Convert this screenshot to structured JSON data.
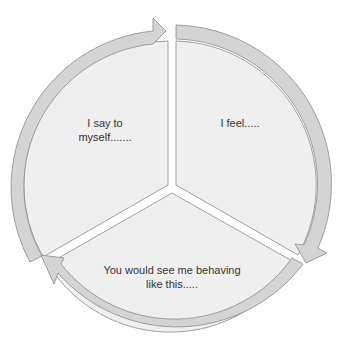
{
  "diagram": {
    "type": "cycle",
    "segments": [
      {
        "id": "self-talk",
        "label_lines": [
          "I say to",
          "myself......."
        ]
      },
      {
        "id": "feelings",
        "label_lines": [
          "I feel....."
        ]
      },
      {
        "id": "behaviour",
        "label_lines": [
          "You would see me behaving",
          "like this....."
        ]
      }
    ],
    "colors": {
      "fill": "#efefef",
      "ring": "#d4d4d4",
      "stroke": "#8a8a8a",
      "background": "#ffffff"
    }
  }
}
